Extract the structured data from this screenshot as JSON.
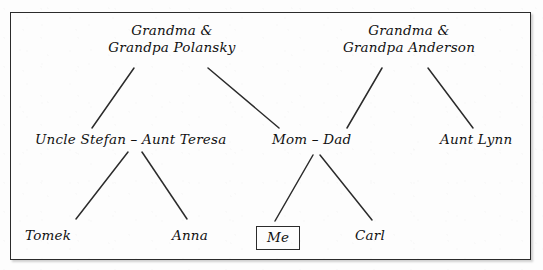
{
  "figure": {
    "type": "family-tree-diagram",
    "frame_color": "#2b2b2b",
    "text_color": "#111111",
    "background_color": "#fdfdfd"
  },
  "nodes": {
    "grandparents_polansky": {
      "line1": "Grandma &",
      "line2": "Grandpa Polansky",
      "x": 172,
      "y": 22
    },
    "grandparents_anderson": {
      "line1": "Grandma &",
      "line2": "Grandpa Anderson",
      "x": 409,
      "y": 22
    },
    "uncle_stefan_aunt_teresa": {
      "label": "Uncle Stefan – Aunt Teresa",
      "x": 35,
      "y": 131
    },
    "mom_dad": {
      "label": "Mom  –  Dad",
      "x": 272,
      "y": 131
    },
    "aunt_lynn": {
      "label": "Aunt Lynn",
      "x": 440,
      "y": 131
    },
    "tomek": {
      "label": "Tomek",
      "x": 25,
      "y": 227
    },
    "anna": {
      "label": "Anna",
      "x": 172,
      "y": 227
    },
    "me": {
      "label": "Me",
      "x": 256,
      "y": 226
    },
    "carl": {
      "label": "Carl",
      "x": 355,
      "y": 227
    }
  },
  "connectors": [
    {
      "name": "polansky-to-stefan",
      "x1": 134,
      "y1": 68,
      "x2": 92,
      "y2": 128
    },
    {
      "name": "polansky-to-mom",
      "x1": 208,
      "y1": 68,
      "x2": 279,
      "y2": 128
    },
    {
      "name": "anderson-to-dad",
      "x1": 382,
      "y1": 68,
      "x2": 347,
      "y2": 128
    },
    {
      "name": "anderson-to-auntlynn",
      "x1": 428,
      "y1": 68,
      "x2": 473,
      "y2": 128
    },
    {
      "name": "stefanteresa-to-tomek",
      "x1": 128,
      "y1": 152,
      "x2": 76,
      "y2": 219
    },
    {
      "name": "stefanteresa-to-anna",
      "x1": 142,
      "y1": 152,
      "x2": 187,
      "y2": 219
    },
    {
      "name": "momdad-to-me",
      "x1": 313,
      "y1": 155,
      "x2": 275,
      "y2": 221
    },
    {
      "name": "momdad-to-carl",
      "x1": 320,
      "y1": 155,
      "x2": 372,
      "y2": 220
    }
  ]
}
